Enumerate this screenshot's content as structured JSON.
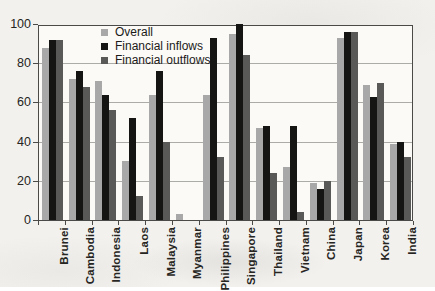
{
  "chart_data": {
    "type": "bar",
    "title": "",
    "xlabel": "",
    "ylabel": "",
    "ylim": [
      0,
      100
    ],
    "yticks": [
      0,
      20,
      40,
      60,
      80,
      100
    ],
    "grid": "horizontal",
    "legend_position": "top-left-inside",
    "categories": [
      "Brunei",
      "Cambodia",
      "Indonesia",
      "Laos",
      "Malaysia",
      "Myanmar",
      "Philippines",
      "Singapore",
      "Thailand",
      "Vietnam",
      "China",
      "Japan",
      "Korea",
      "India"
    ],
    "series": [
      {
        "name": "Overall",
        "color": "#a8a8a8",
        "values": [
          88,
          72,
          71,
          30,
          64,
          3,
          64,
          95,
          47,
          27,
          19,
          93,
          69,
          39
        ]
      },
      {
        "name": "Financial inflows",
        "color": "#151514",
        "values": [
          92,
          76,
          64,
          52,
          76,
          0,
          93,
          100,
          48,
          48,
          16,
          96,
          63,
          40
        ]
      },
      {
        "name": "Financial outflows",
        "color": "#595957",
        "values": [
          92,
          68,
          56,
          12,
          40,
          0,
          32,
          84,
          24,
          4,
          20,
          96,
          70,
          32
        ]
      }
    ],
    "colors": {
      "gridline": "#ababa8",
      "axis": "#4a4a48",
      "plot_background": "#fbfaf7",
      "page_background": "#f2f1ee"
    }
  }
}
